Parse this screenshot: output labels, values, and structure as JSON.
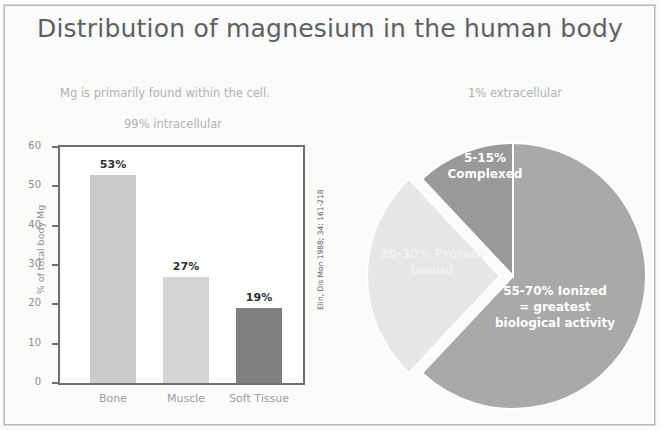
{
  "slide": {
    "title": "Distribution of magnesium in the human body"
  },
  "left_panel": {
    "caption_line1": "Mg is primarily found within the cell.",
    "caption_line2": "99% intracellular",
    "citation": "Elin, Dis Mon 1988; 34: 161-218"
  },
  "right_panel": {
    "caption_line1": "1% extracellular"
  },
  "chart_data": [
    {
      "type": "bar",
      "title": "",
      "xlabel": "",
      "ylabel": "% of total body Mg",
      "categories": [
        "Bone",
        "Muscle",
        "Soft Tissue"
      ],
      "values": [
        53,
        27,
        19
      ],
      "value_labels": [
        "53%",
        "27%",
        "19%"
      ],
      "ylim": [
        0,
        60
      ],
      "yticks": [
        0,
        10,
        20,
        30,
        40,
        50,
        60
      ],
      "ytick_labels": [
        "0",
        "10",
        "20",
        "30",
        "40",
        "50",
        "60"
      ],
      "grid": false,
      "legend": "none",
      "colors": [
        "#cbcbcb",
        "#d5d5d5",
        "#7f7f7f"
      ]
    },
    {
      "type": "pie",
      "title": "",
      "labels": [
        "55-70% Ionized = greatest biological activity",
        "20-30% Protein bound",
        "5-15% Complexed"
      ],
      "values": [
        62,
        26,
        12
      ],
      "colors": [
        "#a9a9a9",
        "#e7e7e7",
        "#999999"
      ],
      "legend": "none",
      "exploded_slice": "20-30% Protein bound",
      "slice_labels": [
        {
          "line1": "55-70% Ionized",
          "line2": "= greatest",
          "line3": "biological activity"
        },
        {
          "line1": "20-30% Protein",
          "line2": "bound",
          "line3": ""
        },
        {
          "line1": "5-15%",
          "line2": "Complexed",
          "line3": ""
        }
      ]
    }
  ]
}
